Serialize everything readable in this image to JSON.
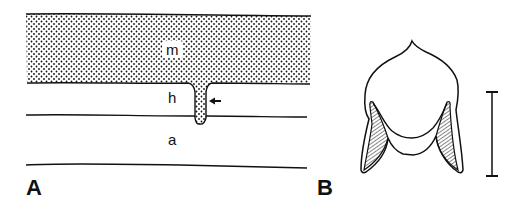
{
  "panels": [
    {
      "id": "A",
      "label": "A",
      "layers": {
        "m": "m",
        "h": "h",
        "a": "a"
      },
      "arrow": "arrow-pointing-left"
    },
    {
      "id": "B",
      "label": "B",
      "scale_bar": "vertical-scale-bar"
    }
  ]
}
